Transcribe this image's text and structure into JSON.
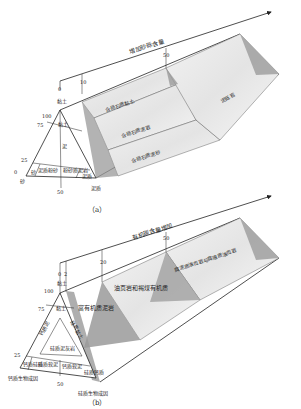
{
  "panel_a": {
    "caption": "（a）",
    "axis_label": "增加砂砾含量",
    "ticks_top": [
      "0",
      "10",
      "50"
    ],
    "left_scale": [
      "100",
      "75",
      "25",
      "0"
    ],
    "vertex_top": "黏土",
    "vertex_left": "砂",
    "vertex_bottom": "泥质",
    "inner_vertical_label": "泥",
    "bottom_scale": "50",
    "triangle_cells": [
      "黏土",
      "砂",
      "泥质粉砂",
      "粉砂质泥岩",
      "泥质"
    ],
    "bands": [
      "含砾石质黏土",
      "含砾石质泥岩",
      "含砾石质泥砂",
      "泥砾岩"
    ]
  },
  "panel_b": {
    "caption": "（b）",
    "axis_label": "有机碳含量增加",
    "ticks_top": [
      "0",
      "2",
      "20",
      "50"
    ],
    "left_scale": [
      "100",
      "75",
      "25"
    ],
    "vertex_top": "黏土",
    "vertex_left": "钙质生物成因",
    "vertex_bottom": "硅质生物成因",
    "bottom_scale": "50",
    "triangle_cells": [
      "黏土",
      "钙质泥",
      "硅质黏土",
      "硅质泥灰岩",
      "钙质硅质",
      "硅质软泥",
      "钙质软泥",
      "硅质钙质"
    ],
    "bands": [
      "富有机质泥岩",
      "油页岩和褐煤有机质",
      "腐泥质油页岩与腐殖质油页岩"
    ]
  }
}
